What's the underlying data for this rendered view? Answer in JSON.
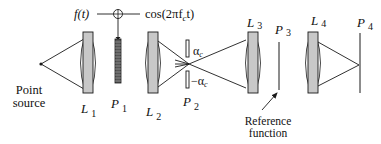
{
  "diagram": {
    "type": "optical-system",
    "labels": {
      "point_source_line1": "Point",
      "point_source_line2": "source",
      "input_signal": "f(t)",
      "carrier": "cos(2πf",
      "carrier_sub": "c",
      "carrier_tail": "t)",
      "L1": "L",
      "L1_sub": "1",
      "P1": "P",
      "P1_sub": "1",
      "L2": "L",
      "L2_sub": "2",
      "P2": "P",
      "P2_sub": "2",
      "L3": "L",
      "L3_sub": "3",
      "P3": "P",
      "P3_sub": "3",
      "L4": "L",
      "L4_sub": "4",
      "P4": "P",
      "P4_sub": "4",
      "alpha_pos": "α",
      "alpha_pos_sub": "c",
      "alpha_neg": "−α",
      "alpha_neg_sub": "c",
      "reference_line1": "Reference",
      "reference_line2": "function"
    },
    "colors": {
      "line": "#1a1a1a",
      "lens_fill": "#c8c8c8",
      "grating_fill": "#555555"
    }
  }
}
